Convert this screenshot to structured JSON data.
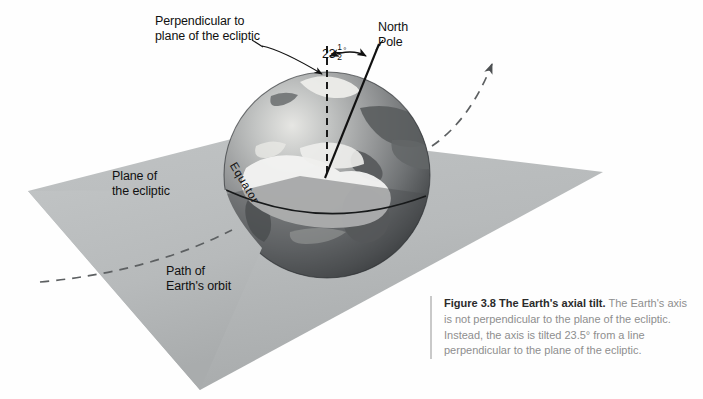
{
  "figure": {
    "kind": "astronomy-diagram",
    "background_color": "#fefefe"
  },
  "labels": {
    "perpendicular": "Perpendicular to\nplane of the ecliptic",
    "north_pole": "North\nPole",
    "plane_of_ecliptic": "Plane of\nthe ecliptic",
    "path_of_orbit": "Path of\nEarth's orbit",
    "equator": "Equator",
    "angle_whole": "23",
    "angle_numerator": "1",
    "angle_denominator": "2",
    "angle_degree_symbol": "°",
    "angle_full_text": "23 1/2°"
  },
  "caption": {
    "lead": "Figure 3.8 The Earth's axial tilt.",
    "body": " The Earth's axis is not perpendicular to the plane of the ecliptic. Instead, the axis is tilted 23.5° from a line perpendicular to the plane of the ecliptic.",
    "figure_number": "3.8",
    "title": "The Earth's axial tilt",
    "tilt_value": "23.5°",
    "lead_color": "#2b2b2b",
    "body_color": "#8e8e8e",
    "rule_color": "#c9c9c9"
  },
  "colors": {
    "ecliptic_plane": "#b9bcbd",
    "ecliptic_plane_shadow": "#a8abac",
    "globe_light": "#e9e9e7",
    "globe_mid": "#8f9192",
    "globe_dark": "#3f4244",
    "globe_below_plane": "#6f7274",
    "land": "#5c5f60",
    "cloud": "#f4f4f2",
    "line_dark": "#111111",
    "orbit_dash": "#5d6062"
  },
  "geometry": {
    "globe_center_x": 327,
    "globe_center_y": 175,
    "globe_radius": 103,
    "axis_tilt_degrees": 23.5,
    "plane_vertices": "28,191 263,131 603,172 200,390",
    "perpendicular_line": "327,48 327,175",
    "axis_line": "375,48 327,175"
  }
}
